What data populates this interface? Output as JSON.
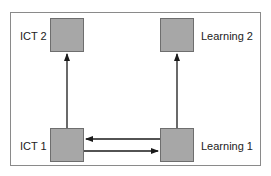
{
  "diagram": {
    "type": "flow",
    "colors": {
      "node_fill": "#a7a7a7",
      "node_border": "#6e6e6e",
      "edge": "#1a1a1a",
      "frame": "#8a8a8a"
    },
    "nodes": [
      {
        "id": "ict2",
        "label": "ICT 2"
      },
      {
        "id": "learning2",
        "label": "Learning 2"
      },
      {
        "id": "ict1",
        "label": "ICT 1"
      },
      {
        "id": "learning1",
        "label": "Learning 1"
      }
    ],
    "edges": [
      {
        "from": "ict1",
        "to": "ict2"
      },
      {
        "from": "learning1",
        "to": "learning2"
      },
      {
        "from": "learning1",
        "to": "ict1"
      },
      {
        "from": "ict1",
        "to": "learning1"
      }
    ]
  }
}
